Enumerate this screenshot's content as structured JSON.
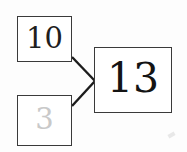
{
  "diagram": {
    "type": "node-graph",
    "background_color": "#fdfdfd",
    "nodes": [
      {
        "id": "input-a",
        "name": "input-node-10",
        "value": "10",
        "state": "active",
        "text_color": "#1e1e1e",
        "border_color": "#3a3a3a",
        "fill_color": "#ffffff",
        "x": 17,
        "y": 16,
        "width": 55,
        "height": 46
      },
      {
        "id": "input-b",
        "name": "input-node-3",
        "value": "3",
        "state": "faded",
        "text_color": "#c9c9c9",
        "border_color": "#3a3a3a",
        "fill_color": "#ffffff",
        "x": 17,
        "y": 95,
        "width": 55,
        "height": 51
      },
      {
        "id": "output",
        "name": "output-node-13",
        "value": "13",
        "state": "active",
        "text_color": "#141414",
        "border_color": "#3a3a3a",
        "fill_color": "#ffffff",
        "x": 94,
        "y": 47,
        "width": 78,
        "height": 66
      }
    ],
    "edges": [
      {
        "id": "edge-a",
        "name": "edge-input-a-to-output",
        "from": "input-a",
        "to": "output",
        "color": "#1c1c1c",
        "width": 2.4,
        "x1": 72,
        "y1": 57,
        "x2": 95,
        "y2": 81
      },
      {
        "id": "edge-b",
        "name": "edge-input-b-to-output",
        "from": "input-b",
        "to": "output",
        "color": "#1c1c1c",
        "width": 2.4,
        "x1": 72,
        "y1": 106,
        "x2": 95,
        "y2": 81
      }
    ],
    "artifacts": [
      {
        "id": "speck-bottom-right",
        "name": "scan-speck",
        "color": "#e8e8e8"
      }
    ]
  }
}
